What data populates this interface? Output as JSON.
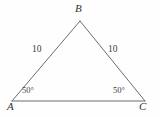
{
  "figure": {
    "type": "geometry-diagram",
    "shape": "isosceles-triangle",
    "background_color": "#fefefe",
    "stroke_color": "#6b6b6b",
    "text_color": "#3a3a3a",
    "vertices": {
      "A": {
        "label": "A",
        "x": 12,
        "y": 101
      },
      "B": {
        "label": "B",
        "x": 80,
        "y": 21
      },
      "C": {
        "label": "C",
        "x": 145,
        "y": 101
      }
    },
    "sides": [
      {
        "name": "AB",
        "label": "10"
      },
      {
        "name": "BC",
        "label": "10"
      },
      {
        "name": "AC",
        "label": ""
      }
    ],
    "angles": [
      {
        "at": "A",
        "label": "50°"
      },
      {
        "at": "C",
        "label": "50°"
      }
    ]
  }
}
